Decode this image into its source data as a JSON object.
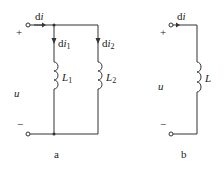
{
  "diagram": {
    "panel_a": {
      "caption": "a",
      "plus": "+",
      "minus": "−",
      "voltage": "u",
      "current_total": {
        "d": "d",
        "i": "i"
      },
      "branch1": {
        "current_d": "d",
        "current_i": "i",
        "current_sub": "1",
        "inductor": "L",
        "inductor_sub": "1"
      },
      "branch2": {
        "current_d": "d",
        "current_i": "i",
        "current_sub": "2",
        "inductor": "L",
        "inductor_sub": "2"
      }
    },
    "panel_b": {
      "caption": "b",
      "plus": "+",
      "minus": "−",
      "voltage": "u",
      "current": {
        "d": "d",
        "i": "i"
      },
      "inductor": "L"
    },
    "colors": {
      "line": "#333333",
      "text": "#222222"
    }
  }
}
